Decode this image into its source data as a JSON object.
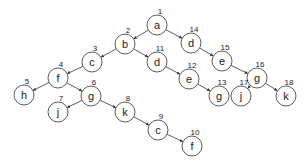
{
  "diagram": {
    "type": "tree",
    "node_radius": 10,
    "nodes": [
      {
        "id": 1,
        "label": "a",
        "x": 157,
        "y": 25
      },
      {
        "id": 2,
        "label": "b",
        "x": 125,
        "y": 44
      },
      {
        "id": 3,
        "label": "c",
        "x": 92,
        "y": 62
      },
      {
        "id": 4,
        "label": "f",
        "x": 58,
        "y": 78
      },
      {
        "id": 5,
        "label": "h",
        "x": 24,
        "y": 95
      },
      {
        "id": 6,
        "label": "g",
        "x": 91,
        "y": 96
      },
      {
        "id": 7,
        "label": "j",
        "x": 58,
        "y": 112
      },
      {
        "id": 8,
        "label": "k",
        "x": 125,
        "y": 112
      },
      {
        "id": 9,
        "label": "c",
        "x": 158,
        "y": 130
      },
      {
        "id": 10,
        "label": "f",
        "x": 192,
        "y": 146
      },
      {
        "id": 11,
        "label": "d",
        "x": 157,
        "y": 62
      },
      {
        "id": 12,
        "label": "e",
        "x": 189,
        "y": 79
      },
      {
        "id": 13,
        "label": "g",
        "x": 219,
        "y": 96
      },
      {
        "id": 14,
        "label": "d",
        "x": 191,
        "y": 43
      },
      {
        "id": 15,
        "label": "e",
        "x": 222,
        "y": 61
      },
      {
        "id": 16,
        "label": "g",
        "x": 257,
        "y": 78
      },
      {
        "id": 17,
        "label": "j",
        "x": 241,
        "y": 96
      },
      {
        "id": 18,
        "label": "k",
        "x": 286,
        "y": 96
      }
    ],
    "edges": [
      [
        1,
        2
      ],
      [
        1,
        14
      ],
      [
        2,
        3
      ],
      [
        2,
        11
      ],
      [
        3,
        4
      ],
      [
        4,
        5
      ],
      [
        4,
        6
      ],
      [
        6,
        7
      ],
      [
        6,
        8
      ],
      [
        8,
        9
      ],
      [
        9,
        10
      ],
      [
        11,
        12
      ],
      [
        12,
        13
      ],
      [
        14,
        15
      ],
      [
        15,
        16
      ],
      [
        16,
        17
      ],
      [
        16,
        18
      ]
    ]
  }
}
